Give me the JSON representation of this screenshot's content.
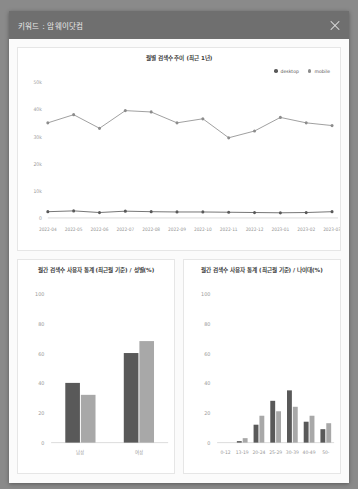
{
  "header": {
    "title": "키워드 : 암웨이닷컴",
    "close_icon": "close-icon"
  },
  "panels": {
    "trend": {
      "title": "월별 검색수 추이 (최근 1년)"
    },
    "gender": {
      "title": "월간 검색수 사용자 통계 (최근월 기준) / 성별(%)"
    },
    "age": {
      "title": "월간 검색수 사용자 통계 (최근월 기준) / 나이대(%)"
    }
  },
  "colors": {
    "dark": "#595959",
    "light": "#a8a8a8",
    "header_bg": "#6f6f6f",
    "axis": "#b8b8b8",
    "tick_text": "#999999"
  },
  "chart_data": [
    {
      "type": "line",
      "title": "월별 검색수 추이 (최근 1년)",
      "xlabel": "",
      "ylabel": "",
      "ylim": [
        0,
        50000
      ],
      "ytick_labels": [
        "50k",
        "40k",
        "30k",
        "20k",
        "10k",
        "0"
      ],
      "ytick_values": [
        50000,
        40000,
        30000,
        20000,
        10000,
        0
      ],
      "grid": false,
      "legend_position": "top-right",
      "x": [
        "2022-04",
        "2022-05",
        "2022-06",
        "2022-07",
        "2022-08",
        "2022-09",
        "2022-10",
        "2022-11",
        "2022-12",
        "2023-01",
        "2023-02",
        "2023-03"
      ],
      "series": [
        {
          "name": "mobile",
          "color": "#8c8c8c",
          "values": [
            35000,
            38000,
            33000,
            39500,
            39000,
            35000,
            36500,
            29500,
            32000,
            37000,
            35000,
            34000
          ]
        },
        {
          "name": "desktop",
          "color": "#595959",
          "values": [
            2300,
            2600,
            2000,
            2500,
            2300,
            2200,
            2200,
            2100,
            2000,
            1900,
            2000,
            2300
          ]
        }
      ]
    },
    {
      "type": "bar",
      "title": "월간 검색수 사용자 통계 (최근월 기준) / 성별(%)",
      "xlabel": "",
      "ylabel": "",
      "ylim": [
        0,
        100
      ],
      "ytick_labels": [
        "100",
        "80",
        "60",
        "40",
        "20",
        "0"
      ],
      "ytick_values": [
        100,
        80,
        60,
        40,
        20,
        0
      ],
      "categories": [
        "남성",
        "여성"
      ],
      "series": [
        {
          "name": "desktop",
          "color": "#595959",
          "values": [
            40,
            60
          ]
        },
        {
          "name": "mobile",
          "color": "#a8a8a8",
          "values": [
            32,
            68
          ]
        }
      ]
    },
    {
      "type": "bar",
      "title": "월간 검색수 사용자 통계 (최근월 기준) / 나이대(%)",
      "xlabel": "",
      "ylabel": "",
      "ylim": [
        0,
        100
      ],
      "ytick_labels": [
        "100",
        "80",
        "60",
        "40",
        "20",
        "0"
      ],
      "ytick_values": [
        100,
        80,
        60,
        40,
        20,
        0
      ],
      "categories": [
        "0-12",
        "13-19",
        "20-24",
        "25-29",
        "30-39",
        "40-49",
        "50-"
      ],
      "series": [
        {
          "name": "desktop",
          "color": "#595959",
          "values": [
            0,
            1,
            12,
            28,
            35,
            14,
            9
          ]
        },
        {
          "name": "mobile",
          "color": "#a8a8a8",
          "values": [
            0,
            3,
            18,
            21,
            24,
            18,
            13
          ]
        }
      ]
    }
  ]
}
